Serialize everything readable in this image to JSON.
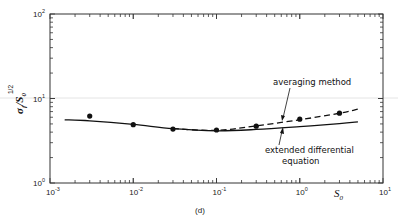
{
  "chart_data": {
    "type": "line",
    "title": "",
    "caption": "(d)",
    "xlabel": "S",
    "xlabel_sub": "0",
    "ylabel": "σ",
    "ylabel_parts": {
      "base": "σ",
      "base_sub": "f",
      "slash": "/",
      "denom": "S",
      "denom_sub": "0",
      "exponent": "1/2"
    },
    "xscale": "log",
    "yscale": "log",
    "xlim": [
      0.001,
      10
    ],
    "ylim": [
      1,
      100
    ],
    "grid": false,
    "x_ticks": [
      {
        "value": 0.001,
        "base": "10",
        "exp": "-3"
      },
      {
        "value": 0.01,
        "base": "10",
        "exp": "-2"
      },
      {
        "value": 0.1,
        "base": "10",
        "exp": "-1"
      },
      {
        "value": 1,
        "base": "10",
        "exp": "0"
      },
      {
        "value": 10,
        "base": "10",
        "exp": "1"
      }
    ],
    "y_ticks": [
      {
        "value": 1,
        "base": "10",
        "exp": "0"
      },
      {
        "value": 10,
        "base": "10",
        "exp": "1"
      },
      {
        "value": 100,
        "base": "10",
        "exp": "2"
      }
    ],
    "series": [
      {
        "name": "extended differential equation",
        "style": "solid",
        "x": [
          0.0015,
          0.003,
          0.01,
          0.03,
          0.1,
          0.3,
          1,
          3,
          5
        ],
        "y": [
          5.6,
          5.45,
          4.95,
          4.4,
          4.15,
          4.3,
          4.65,
          5.05,
          5.3
        ]
      },
      {
        "name": "averaging method",
        "style": "dashed",
        "x": [
          0.03,
          0.1,
          0.3,
          1,
          3,
          5
        ],
        "y": [
          4.4,
          4.2,
          4.75,
          5.6,
          6.7,
          7.5
        ]
      },
      {
        "name": "data points",
        "style": "markers",
        "x": [
          0.003,
          0.01,
          0.03,
          0.1,
          0.3,
          1,
          3
        ],
        "y": [
          6.2,
          4.9,
          4.35,
          4.24,
          4.7,
          5.7,
          6.7
        ]
      }
    ],
    "annotations": [
      {
        "text": "averaging method",
        "target_series": "averaging method",
        "arrow_to": [
          0.22,
          4.9
        ]
      },
      {
        "text_lines": [
          "extended  differential",
          "equation"
        ],
        "target_series": "extended differential equation",
        "arrow_to": [
          0.2,
          4.4
        ]
      }
    ]
  }
}
